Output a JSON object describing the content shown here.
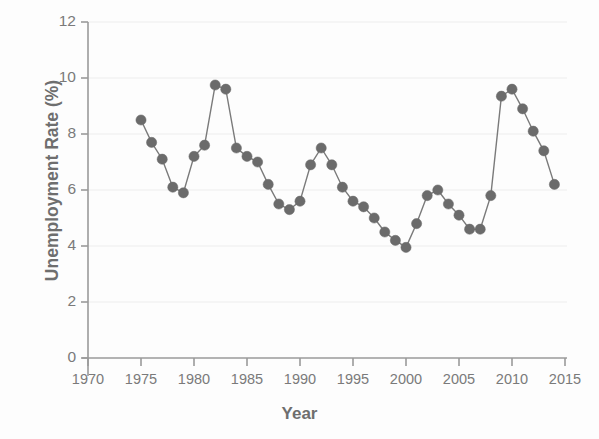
{
  "chart_data": {
    "type": "line",
    "title": "",
    "subtitle": "",
    "xlabel": "Year",
    "ylabel": "Unemployment Rate (%)",
    "xlim": [
      1970,
      2015
    ],
    "ylim": [
      0,
      12
    ],
    "xticks": [
      1970,
      1975,
      1980,
      1985,
      1990,
      1995,
      2000,
      2005,
      2010,
      2015
    ],
    "yticks": [
      0,
      2,
      4,
      6,
      8,
      10,
      12
    ],
    "grid": "horizontal",
    "legend": "none",
    "marker": "circle",
    "marker_color": "#6b6b6b",
    "line_color": "#7a7a7a",
    "x": [
      1975,
      1976,
      1977,
      1978,
      1979,
      1980,
      1981,
      1982,
      1983,
      1984,
      1985,
      1986,
      1987,
      1988,
      1989,
      1990,
      1991,
      1992,
      1993,
      1994,
      1995,
      1996,
      1997,
      1998,
      1999,
      2000,
      2001,
      2002,
      2003,
      2004,
      2005,
      2006,
      2007,
      2008,
      2009,
      2010,
      2011,
      2012,
      2013,
      2014
    ],
    "values": [
      8.5,
      7.7,
      7.1,
      6.1,
      5.9,
      7.2,
      7.6,
      9.75,
      9.6,
      7.5,
      7.2,
      7.0,
      6.2,
      5.5,
      5.3,
      5.6,
      6.9,
      7.5,
      6.9,
      6.1,
      5.6,
      5.4,
      5.0,
      4.5,
      4.2,
      3.95,
      4.8,
      5.8,
      6.0,
      5.5,
      5.1,
      4.6,
      4.6,
      5.8,
      9.35,
      9.6,
      8.9,
      8.1,
      7.4,
      6.2
    ],
    "axis_style": "open-L"
  }
}
